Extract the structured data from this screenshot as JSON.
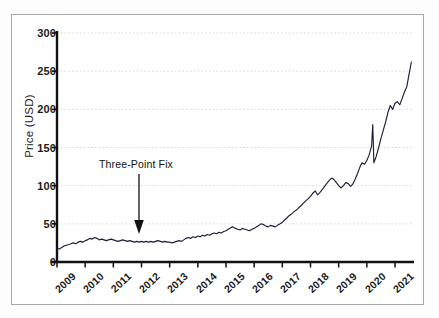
{
  "figure": {
    "background_color": "#ffffff",
    "frame_color": "#a9a9a9",
    "axis_color": "#111111",
    "gridline_color": "#c8c8d8",
    "series_color": "#1d1d3a"
  },
  "annotation": {
    "text": "Three-Point Fix",
    "arrow_name": "down-arrow",
    "points_to_year": 2012,
    "points_to_value": 27
  },
  "chart_data": {
    "type": "line",
    "title": "",
    "xlabel": "",
    "ylabel": "Price (USD)",
    "ylim": [
      0,
      300
    ],
    "yticks": [
      0,
      50,
      100,
      150,
      200,
      250,
      300
    ],
    "ytick_labels": [
      "0",
      "50",
      "100",
      "150",
      "200",
      "250",
      "300"
    ],
    "xlim": [
      2009,
      2021.6
    ],
    "xticks": [
      2009,
      2010,
      2011,
      2012,
      2013,
      2014,
      2015,
      2016,
      2017,
      2018,
      2019,
      2020,
      2021
    ],
    "xtick_labels": [
      "2009",
      "2010",
      "2011",
      "2012",
      "2013",
      "2014",
      "2015",
      "2016",
      "2017",
      "2018",
      "2019",
      "2020",
      "2021"
    ],
    "grid": true,
    "grid_axis": "y",
    "legend": false,
    "series": [
      {
        "name": "Price",
        "x": [
          2009.0,
          2009.08,
          2009.17,
          2009.25,
          2009.33,
          2009.42,
          2009.5,
          2009.58,
          2009.67,
          2009.75,
          2009.83,
          2009.92,
          2010.0,
          2010.08,
          2010.17,
          2010.25,
          2010.33,
          2010.42,
          2010.5,
          2010.58,
          2010.67,
          2010.75,
          2010.83,
          2010.92,
          2011.0,
          2011.08,
          2011.17,
          2011.25,
          2011.33,
          2011.42,
          2011.5,
          2011.58,
          2011.67,
          2011.75,
          2011.83,
          2011.92,
          2012.0,
          2012.08,
          2012.17,
          2012.25,
          2012.33,
          2012.42,
          2012.5,
          2012.58,
          2012.67,
          2012.75,
          2012.83,
          2012.92,
          2013.0,
          2013.08,
          2013.17,
          2013.25,
          2013.33,
          2013.42,
          2013.5,
          2013.58,
          2013.67,
          2013.75,
          2013.83,
          2013.92,
          2014.0,
          2014.08,
          2014.17,
          2014.25,
          2014.33,
          2014.42,
          2014.5,
          2014.58,
          2014.67,
          2014.75,
          2014.83,
          2014.92,
          2015.0,
          2015.08,
          2015.17,
          2015.25,
          2015.33,
          2015.42,
          2015.5,
          2015.58,
          2015.67,
          2015.75,
          2015.83,
          2015.92,
          2016.0,
          2016.08,
          2016.17,
          2016.25,
          2016.33,
          2016.42,
          2016.5,
          2016.58,
          2016.67,
          2016.75,
          2016.83,
          2016.92,
          2017.0,
          2017.08,
          2017.17,
          2017.25,
          2017.33,
          2017.42,
          2017.5,
          2017.58,
          2017.67,
          2017.75,
          2017.83,
          2017.92,
          2018.0,
          2018.08,
          2018.17,
          2018.25,
          2018.33,
          2018.42,
          2018.5,
          2018.58,
          2018.67,
          2018.75,
          2018.83,
          2018.92,
          2019.0,
          2019.08,
          2019.17,
          2019.25,
          2019.33,
          2019.42,
          2019.5,
          2019.58,
          2019.67,
          2019.75,
          2019.83,
          2019.92,
          2020.0,
          2020.08,
          2020.17,
          2020.21,
          2020.25,
          2020.33,
          2020.42,
          2020.5,
          2020.58,
          2020.67,
          2020.75,
          2020.83,
          2020.92,
          2021.0,
          2021.08,
          2021.17,
          2021.25,
          2021.33,
          2021.42,
          2021.5,
          2021.58
        ],
        "y": [
          18,
          17,
          19,
          21,
          22,
          23,
          24,
          25,
          24,
          26,
          27,
          26,
          28,
          29,
          31,
          30,
          32,
          31,
          29,
          30,
          29,
          28,
          29,
          30,
          29,
          28,
          27,
          28,
          29,
          28,
          27,
          28,
          27,
          26,
          27,
          26,
          27,
          26,
          27,
          26,
          27,
          26,
          27,
          28,
          27,
          26,
          27,
          26,
          26,
          25,
          26,
          27,
          28,
          27,
          29,
          31,
          32,
          31,
          33,
          32,
          34,
          33,
          35,
          34,
          36,
          35,
          37,
          38,
          37,
          39,
          38,
          40,
          41,
          43,
          45,
          46,
          44,
          43,
          42,
          44,
          43,
          42,
          41,
          43,
          44,
          46,
          48,
          50,
          49,
          47,
          46,
          48,
          47,
          46,
          48,
          50,
          52,
          55,
          58,
          61,
          63,
          66,
          68,
          71,
          74,
          77,
          80,
          83,
          86,
          90,
          93,
          88,
          91,
          95,
          99,
          103,
          107,
          110,
          108,
          104,
          100,
          97,
          100,
          104,
          103,
          99,
          102,
          108,
          116,
          124,
          130,
          128,
          133,
          140,
          152,
          180,
          130,
          138,
          150,
          162,
          172,
          184,
          196,
          205,
          200,
          208,
          210,
          206,
          214,
          222,
          230,
          246,
          262
        ]
      }
    ]
  }
}
